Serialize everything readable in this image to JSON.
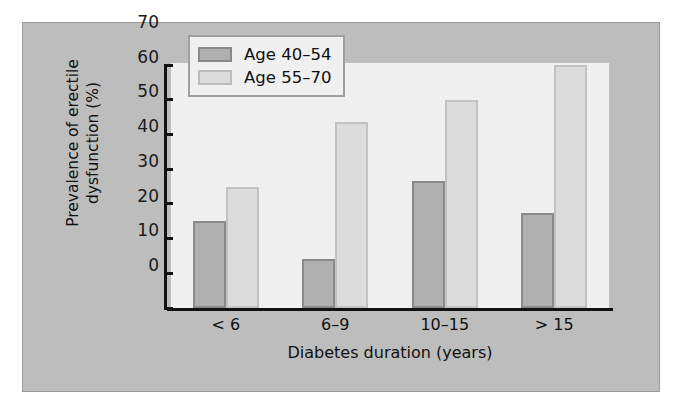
{
  "chart_data": {
    "type": "bar",
    "title": "",
    "subtitle": "",
    "xlabel": "Diabetes duration (years)",
    "ylabel_line1": "Prevalence of erectile",
    "ylabel_line2": "dysfunction (%)",
    "ylabel": "Prevalence of erectile dysfunction (%)",
    "categories": [
      "< 6",
      "6–9",
      "10–15",
      "> 15"
    ],
    "series": [
      {
        "name": "Age 40–54",
        "values": [
          25,
          14,
          36.5,
          27.5
        ],
        "color": "#b0b0b0",
        "edge_color": "#8a8a8a"
      },
      {
        "name": "Age 55–70",
        "values": [
          35,
          53.5,
          60,
          70
        ],
        "color": "#dcdcdc",
        "edge_color": "#c2c2c2"
      }
    ],
    "ylim": [
      0,
      70
    ],
    "ytick_labels": [
      "0",
      "10",
      "20",
      "30",
      "40",
      "50",
      "60",
      "70"
    ],
    "ytick_values": [
      0,
      10,
      20,
      30,
      40,
      50,
      60,
      70
    ],
    "grid": false,
    "legend_position": "top-left",
    "plot_background": "#f0f0f0",
    "figure_background": "#bdbdbd"
  }
}
